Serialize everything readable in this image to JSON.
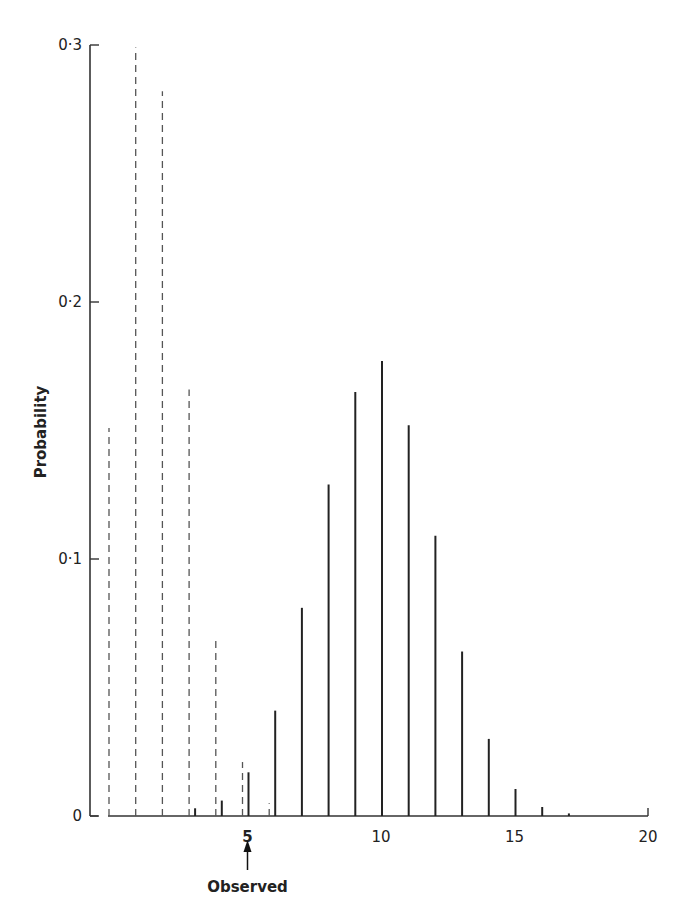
{
  "chart_data": {
    "type": "bar",
    "title": "",
    "xlabel": "",
    "ylabel": "Probability",
    "xlim": [
      0,
      20
    ],
    "ylim": [
      0,
      0.3
    ],
    "grid": false,
    "x_ticks": [
      "5",
      "10",
      "15",
      "20"
    ],
    "y_ticks": [
      "0",
      "0·1",
      "0·2",
      "0·3"
    ],
    "annotation": {
      "x": 5,
      "label": "Observed",
      "arrow": "up"
    },
    "series": [
      {
        "name": "dashed distribution",
        "style": "dashed",
        "x": [
          0,
          1,
          2,
          3,
          4,
          5,
          6
        ],
        "values": [
          0.151,
          0.299,
          0.282,
          0.166,
          0.069,
          0.021,
          0.005
        ]
      },
      {
        "name": "solid distribution",
        "style": "solid",
        "x": [
          3,
          4,
          5,
          6,
          7,
          8,
          9,
          10,
          11,
          12,
          13,
          14,
          15,
          16,
          17
        ],
        "values": [
          0.003,
          0.006,
          0.017,
          0.041,
          0.081,
          0.129,
          0.165,
          0.177,
          0.152,
          0.109,
          0.064,
          0.03,
          0.0105,
          0.0035,
          0.001
        ]
      }
    ]
  },
  "labels": {
    "ylabel": "Probability",
    "observed": "Observed",
    "observed_value": "5"
  }
}
